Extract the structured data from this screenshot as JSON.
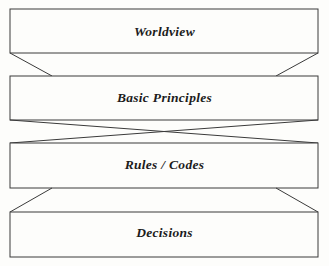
{
  "diagram": {
    "type": "hierarchy-funnel",
    "orientation": "vertical-top-down",
    "background_color": "#fdfdfb",
    "stroke_color": "#3a3a3a",
    "fill_color": "#fdfdfb",
    "tiers": [
      {
        "index": 0,
        "label": "Worldview",
        "box": {
          "x": 10,
          "y": 9,
          "width": 308,
          "height": 44
        },
        "connector_to_next": "taper-in"
      },
      {
        "index": 1,
        "label": "Basic Principles",
        "box": {
          "x": 10,
          "y": 76,
          "width": 308,
          "height": 44
        },
        "connector_to_next": "cross-x"
      },
      {
        "index": 2,
        "label": "Rules / Codes",
        "box": {
          "x": 10,
          "y": 143,
          "width": 308,
          "height": 45
        },
        "connector_to_next": "taper-out"
      },
      {
        "index": 3,
        "label": "Decisions",
        "box": {
          "x": 10,
          "y": 212,
          "width": 308,
          "height": 45
        },
        "connector_to_next": null
      }
    ],
    "connectors": [
      {
        "name": "worldview-to-basic-principles",
        "from_tier": 0,
        "to_tier": 1,
        "left_line": {
          "x1": 10,
          "y1": 53,
          "x2": 52,
          "y2": 76
        },
        "right_line": {
          "x1": 318,
          "y1": 53,
          "x2": 276,
          "y2": 76
        }
      },
      {
        "name": "basic-principles-to-rules-codes",
        "from_tier": 1,
        "to_tier": 2,
        "left_line": {
          "x1": 10,
          "y1": 120,
          "x2": 318,
          "y2": 143
        },
        "right_line": {
          "x1": 318,
          "y1": 120,
          "x2": 10,
          "y2": 143
        }
      },
      {
        "name": "rules-codes-to-decisions",
        "from_tier": 2,
        "to_tier": 3,
        "left_line": {
          "x1": 52,
          "y1": 188,
          "x2": 10,
          "y2": 212
        },
        "right_line": {
          "x1": 276,
          "y1": 188,
          "x2": 318,
          "y2": 212
        }
      }
    ]
  }
}
